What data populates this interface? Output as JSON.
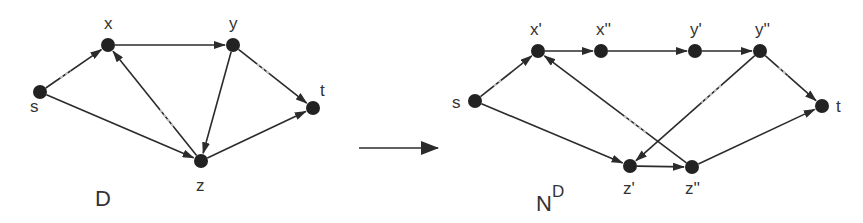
{
  "left_graph": {
    "title": "D",
    "nodes": [
      {
        "id": "s",
        "label": "s",
        "x": 40,
        "y": 92,
        "lx": 30,
        "ly": 112
      },
      {
        "id": "x",
        "label": "x",
        "x": 108,
        "y": 45,
        "lx": 104,
        "ly": 29
      },
      {
        "id": "y",
        "label": "y",
        "x": 233,
        "y": 45,
        "lx": 229,
        "ly": 29
      },
      {
        "id": "t",
        "label": "t",
        "x": 313,
        "y": 108,
        "lx": 320,
        "ly": 96
      },
      {
        "id": "z",
        "label": "z",
        "x": 201,
        "y": 161,
        "lx": 196,
        "ly": 191
      }
    ],
    "edges": [
      {
        "from": "s",
        "to": "x",
        "light": true
      },
      {
        "from": "s",
        "to": "z",
        "light": false
      },
      {
        "from": "x",
        "to": "y",
        "light": false
      },
      {
        "from": "z",
        "to": "x",
        "light": true
      },
      {
        "from": "y",
        "to": "z",
        "light": false
      },
      {
        "from": "y",
        "to": "t",
        "light": true
      },
      {
        "from": "z",
        "to": "t",
        "light": false
      }
    ]
  },
  "transform_arrow": {
    "x1": 359,
    "y1": 148,
    "x2": 438,
    "y2": 148
  },
  "right_graph": {
    "title": "N",
    "title_sup": "D",
    "nodes": [
      {
        "id": "s",
        "label": "s",
        "x": 475,
        "y": 101,
        "lx": 452,
        "ly": 108
      },
      {
        "id": "x1",
        "label": "x'",
        "x": 538,
        "y": 51,
        "lx": 530,
        "ly": 35
      },
      {
        "id": "x2",
        "label": "x''",
        "x": 601,
        "y": 51,
        "lx": 596,
        "ly": 35
      },
      {
        "id": "y1",
        "label": "y'",
        "x": 695,
        "y": 51,
        "lx": 690,
        "ly": 35
      },
      {
        "id": "y2",
        "label": "y''",
        "x": 760,
        "y": 51,
        "lx": 755,
        "ly": 35
      },
      {
        "id": "t",
        "label": "t",
        "x": 822,
        "y": 106,
        "lx": 836,
        "ly": 112
      },
      {
        "id": "z1",
        "label": "z'",
        "x": 630,
        "y": 166,
        "lx": 623,
        "ly": 194
      },
      {
        "id": "z2",
        "label": "z''",
        "x": 692,
        "y": 167,
        "lx": 685,
        "ly": 194
      }
    ],
    "edges": [
      {
        "from": "s",
        "to": "x1",
        "light": true
      },
      {
        "from": "s",
        "to": "z1",
        "light": false
      },
      {
        "from": "x1",
        "to": "x2",
        "light": false
      },
      {
        "from": "x2",
        "to": "y1",
        "light": false
      },
      {
        "from": "y1",
        "to": "y2",
        "light": false
      },
      {
        "from": "y2",
        "to": "z1",
        "light": true
      },
      {
        "from": "y2",
        "to": "t",
        "light": true
      },
      {
        "from": "z1",
        "to": "z2",
        "light": false
      },
      {
        "from": "z2",
        "to": "x1",
        "light": true
      },
      {
        "from": "z2",
        "to": "t",
        "light": false
      }
    ]
  },
  "style": {
    "node_color": "#222222",
    "edge_color": "#2b2b2b",
    "label_color": "#333333"
  }
}
